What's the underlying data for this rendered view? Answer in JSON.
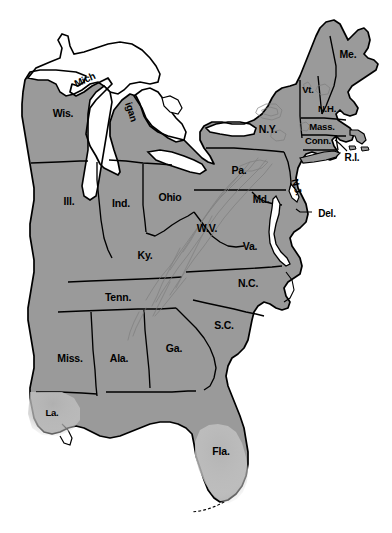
{
  "map": {
    "title": "Eastern United States state map",
    "type": "political-choropleth-outline",
    "background_color": "#ffffff",
    "land_fill_color": "#9a9a9a",
    "water_fill_color": "#ffffff",
    "border_color": "#000000",
    "partial_shade_color": "#bcbcbc",
    "relief_color": "#8a8a8a",
    "label_color": "#000000",
    "width": 392,
    "height": 533
  },
  "labels": [
    {
      "name": "wisconsin",
      "text": "Wis.",
      "x": 63,
      "y": 113,
      "size": 10.5,
      "rotate": 0
    },
    {
      "name": "michigan-up",
      "text": "Mich",
      "x": 85,
      "y": 80,
      "size": 10,
      "rotate": -24
    },
    {
      "name": "michigan-lp",
      "text": "igan",
      "x": 131,
      "y": 112,
      "size": 10,
      "rotate": 72
    },
    {
      "name": "illinois",
      "text": "Ill.",
      "x": 69,
      "y": 201,
      "size": 10.5,
      "rotate": 0
    },
    {
      "name": "indiana",
      "text": "Ind.",
      "x": 121,
      "y": 203,
      "size": 10.5,
      "rotate": 0
    },
    {
      "name": "ohio",
      "text": "Ohio",
      "x": 170,
      "y": 197,
      "size": 10.5,
      "rotate": 0
    },
    {
      "name": "kentucky",
      "text": "Ky.",
      "x": 145,
      "y": 255,
      "size": 10.5,
      "rotate": 0
    },
    {
      "name": "tennessee",
      "text": "Tenn.",
      "x": 118,
      "y": 297,
      "size": 10.5,
      "rotate": 0
    },
    {
      "name": "mississippi",
      "text": "Miss.",
      "x": 70,
      "y": 358,
      "size": 10.5,
      "rotate": 0
    },
    {
      "name": "alabama",
      "text": "Ala.",
      "x": 119,
      "y": 358,
      "size": 10.5,
      "rotate": 0
    },
    {
      "name": "georgia",
      "text": "Ga.",
      "x": 174,
      "y": 348,
      "size": 10.5,
      "rotate": 0
    },
    {
      "name": "louisiana",
      "text": "La.",
      "x": 52,
      "y": 413,
      "size": 9.5,
      "rotate": 0
    },
    {
      "name": "florida",
      "text": "Fla.",
      "x": 221,
      "y": 451,
      "size": 10.5,
      "rotate": 0
    },
    {
      "name": "south-carolina",
      "text": "S.C.",
      "x": 224,
      "y": 325,
      "size": 10.5,
      "rotate": 0
    },
    {
      "name": "north-carolina",
      "text": "N.C.",
      "x": 248,
      "y": 283,
      "size": 10.5,
      "rotate": 0
    },
    {
      "name": "virginia",
      "text": "Va.",
      "x": 250,
      "y": 246,
      "size": 10.5,
      "rotate": 0
    },
    {
      "name": "west-virginia",
      "text": "W.V.",
      "x": 207,
      "y": 228,
      "size": 10.5,
      "rotate": 0
    },
    {
      "name": "maryland",
      "text": "Md.",
      "x": 261,
      "y": 200,
      "size": 10,
      "rotate": 0
    },
    {
      "name": "delaware",
      "text": "Del.",
      "x": 327,
      "y": 214,
      "size": 10,
      "rotate": 0
    },
    {
      "name": "new-jersey",
      "text": "N.J.",
      "x": 297,
      "y": 187,
      "size": 9.5,
      "rotate": 74
    },
    {
      "name": "pennsylvania",
      "text": "Pa.",
      "x": 239,
      "y": 170,
      "size": 10.5,
      "rotate": 0
    },
    {
      "name": "new-york",
      "text": "N.Y.",
      "x": 268,
      "y": 129,
      "size": 10.5,
      "rotate": 0
    },
    {
      "name": "connecticut",
      "text": "Conn.",
      "x": 318,
      "y": 141,
      "size": 9.5,
      "rotate": 0
    },
    {
      "name": "rhode-island",
      "text": "R.I.",
      "x": 352,
      "y": 158,
      "size": 10,
      "rotate": 0
    },
    {
      "name": "massachusetts",
      "text": "Mass.",
      "x": 322,
      "y": 127,
      "size": 9.5,
      "rotate": 0
    },
    {
      "name": "new-hampshire",
      "text": "N.H.",
      "x": 327,
      "y": 109,
      "size": 9.5,
      "rotate": 0
    },
    {
      "name": "vermont",
      "text": "Vt.",
      "x": 308,
      "y": 90,
      "size": 9.5,
      "rotate": 0
    },
    {
      "name": "maine",
      "text": "Me.",
      "x": 348,
      "y": 54,
      "size": 10.5,
      "rotate": 0
    }
  ],
  "leader_lines": [
    {
      "name": "delaware-leader",
      "from_x": 313,
      "from_y": 212,
      "to_x": 297,
      "to_y": 209
    },
    {
      "name": "rhode-island-leader",
      "from_x": 348,
      "from_y": 151,
      "to_x": 335,
      "to_y": 140
    }
  ]
}
